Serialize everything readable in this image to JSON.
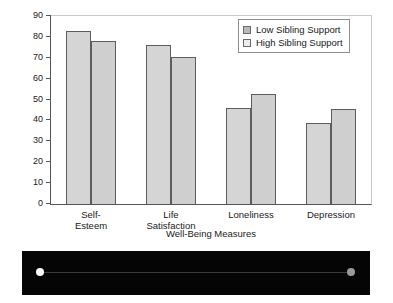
{
  "chart_data": {
    "type": "bar",
    "title": "",
    "xlabel": "Well-Being Measures",
    "ylabel": "Percent",
    "ylim": [
      0,
      90
    ],
    "yticks": [
      0,
      10,
      20,
      30,
      40,
      50,
      60,
      70,
      80,
      90
    ],
    "grid": false,
    "legend_position": "top-right",
    "categories": [
      "Self-Esteem",
      "Life\nSatisfaction",
      "Loneliness",
      "Depression"
    ],
    "series": [
      {
        "name": "Low Sibling Support",
        "values": [
          83,
          76,
          46,
          39
        ]
      },
      {
        "name": "High Sibling Support",
        "values": [
          78,
          70.5,
          52.5,
          45.5
        ]
      }
    ]
  },
  "legend": {
    "items": [
      {
        "label": "Low Sibling Support",
        "swatch": "low-support-swatch"
      },
      {
        "label": "High Sibling Support",
        "swatch": "high-support-swatch"
      }
    ]
  },
  "artifact": {
    "left_dot": "bright-white-dot",
    "right_dot": "dim-gray-dot"
  },
  "colors": {
    "bar_low": "#d5d5d5",
    "bar_high": "#cfcfcf",
    "bar_edge": "#5d5d5d",
    "axis": "#555555",
    "text": "#1a1a1a",
    "strip": "#050505"
  }
}
